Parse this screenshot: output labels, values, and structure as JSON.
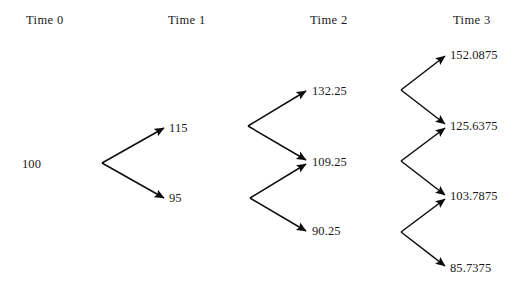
{
  "diagram": {
    "type": "binomial-tree",
    "title": "",
    "stroke_color": "#0d0d0d",
    "text_color": "#1a1a1a",
    "background_color": "#ffffff",
    "columns": [
      {
        "label": "Time 0",
        "x": 26,
        "y": 13
      },
      {
        "label": "Time 1",
        "x": 168,
        "y": 13
      },
      {
        "label": "Time 2",
        "x": 310,
        "y": 13
      },
      {
        "label": "Time 3",
        "x": 453,
        "y": 13
      }
    ],
    "nodes": [
      {
        "id": "n0",
        "time": 0,
        "value": "100",
        "x": 22,
        "y": 157
      },
      {
        "id": "n1u",
        "time": 1,
        "value": "115",
        "x": 169,
        "y": 121
      },
      {
        "id": "n1d",
        "time": 1,
        "value": "95",
        "x": 169,
        "y": 191
      },
      {
        "id": "n2uu",
        "time": 2,
        "value": "132.25",
        "x": 312,
        "y": 84
      },
      {
        "id": "n2ud",
        "time": 2,
        "value": "109.25",
        "x": 312,
        "y": 155
      },
      {
        "id": "n2dd",
        "time": 2,
        "value": "90.25",
        "x": 312,
        "y": 224
      },
      {
        "id": "n3a",
        "time": 3,
        "value": "152.0875",
        "x": 450,
        "y": 48
      },
      {
        "id": "n3b",
        "time": 3,
        "value": "125.6375",
        "x": 450,
        "y": 119
      },
      {
        "id": "n3c",
        "time": 3,
        "value": "103.7875",
        "x": 450,
        "y": 189
      },
      {
        "id": "n3d",
        "time": 3,
        "value": "85.7375",
        "x": 450,
        "y": 261
      }
    ],
    "edges": [
      {
        "from": "n0",
        "to": "n1u",
        "direction": "up",
        "x1": 102,
        "y1": 163,
        "x2": 164,
        "y2": 128
      },
      {
        "from": "n0",
        "to": "n1d",
        "direction": "down",
        "x1": 102,
        "y1": 163,
        "x2": 164,
        "y2": 198
      },
      {
        "from": "n1u",
        "to": "n2uu",
        "direction": "up",
        "x1": 248,
        "y1": 126,
        "x2": 306,
        "y2": 91
      },
      {
        "from": "n1u",
        "to": "n2ud",
        "direction": "down",
        "x1": 248,
        "y1": 126,
        "x2": 306,
        "y2": 160
      },
      {
        "from": "n1d",
        "to": "n2ud",
        "direction": "up",
        "x1": 250,
        "y1": 198,
        "x2": 306,
        "y2": 164
      },
      {
        "from": "n1d",
        "to": "n2dd",
        "direction": "down",
        "x1": 250,
        "y1": 198,
        "x2": 306,
        "y2": 231
      },
      {
        "from": "n2uu",
        "to": "n3a",
        "direction": "up",
        "x1": 401,
        "y1": 90,
        "x2": 445,
        "y2": 56
      },
      {
        "from": "n2uu",
        "to": "n3b",
        "direction": "down",
        "x1": 401,
        "y1": 90,
        "x2": 445,
        "y2": 124
      },
      {
        "from": "n2ud",
        "to": "n3b",
        "direction": "up",
        "x1": 401,
        "y1": 161,
        "x2": 445,
        "y2": 128
      },
      {
        "from": "n2ud",
        "to": "n3c",
        "direction": "down",
        "x1": 401,
        "y1": 161,
        "x2": 445,
        "y2": 195
      },
      {
        "from": "n2dd",
        "to": "n3c",
        "direction": "up",
        "x1": 401,
        "y1": 232,
        "x2": 445,
        "y2": 199
      },
      {
        "from": "n2dd",
        "to": "n3d",
        "direction": "down",
        "x1": 401,
        "y1": 232,
        "x2": 445,
        "y2": 266
      }
    ]
  }
}
